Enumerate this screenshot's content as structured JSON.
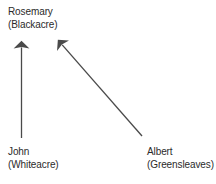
{
  "diagram": {
    "type": "conveyance-arrow-diagram",
    "background_color": "#ffffff",
    "text_color": "#2b2b2b",
    "arrow_color": "#4a4a4a",
    "width": 216,
    "height": 184,
    "nodes": [
      {
        "id": "rosemary",
        "name": "Rosemary",
        "parcel": "(Blackacre)",
        "position": "top-left"
      },
      {
        "id": "john",
        "name": "John",
        "parcel": "(Whiteacre)",
        "position": "bottom-left"
      },
      {
        "id": "albert",
        "name": "Albert",
        "parcel": "(Greensleaves)",
        "position": "bottom-right"
      }
    ],
    "arrows": [
      {
        "id": "john-to-rosemary",
        "from": "john",
        "to": "rosemary",
        "orientation": "vertical-up",
        "x1": 21.5,
        "y1": 138,
        "x2": 21.5,
        "y2": 41
      },
      {
        "id": "albert-to-rosemary",
        "from": "albert",
        "to": "rosemary",
        "orientation": "diagonal-up-left",
        "x1": 142,
        "y1": 136,
        "x2": 58,
        "y2": 40
      }
    ]
  }
}
